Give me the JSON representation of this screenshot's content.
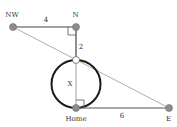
{
  "diagram": {
    "type": "geometry",
    "points": [
      {
        "id": "NW",
        "label": "NW",
        "x": 13,
        "y": 27,
        "style": "gray-dot"
      },
      {
        "id": "N",
        "label": "N",
        "x": 76,
        "y": 27,
        "style": "gray-dot"
      },
      {
        "id": "P",
        "label": "",
        "x": 76,
        "y": 60,
        "style": "white-dot"
      },
      {
        "id": "Home",
        "label": "Home",
        "x": 76,
        "y": 108,
        "style": "gray-dot"
      },
      {
        "id": "E",
        "label": "E",
        "x": 169,
        "y": 108,
        "style": "gray-dot"
      }
    ],
    "segments": [
      {
        "from": "NW",
        "to": "N",
        "label": "4"
      },
      {
        "from": "N",
        "to": "P",
        "label": "2"
      },
      {
        "from": "P",
        "to": "Home",
        "label": "X"
      },
      {
        "from": "Home",
        "to": "E",
        "label": "6"
      },
      {
        "from": "NW",
        "to": "E",
        "label": ""
      }
    ],
    "circle": {
      "cx": 76,
      "cy": 84,
      "r": 24
    },
    "right_angles": [
      "N",
      "Home"
    ],
    "labels": {
      "nw": "NW",
      "n": "N",
      "home": "Home",
      "e": "E",
      "seg_nw_n": "4",
      "seg_n_p": "2",
      "seg_p_home": "X",
      "seg_home_e": "6"
    },
    "colors": {
      "line": "#333333",
      "thin_line": "#888888",
      "dot_fill": "#8c8c8c",
      "dot_stroke": "#6e6e6e",
      "circle": "#1a1a1a"
    }
  }
}
